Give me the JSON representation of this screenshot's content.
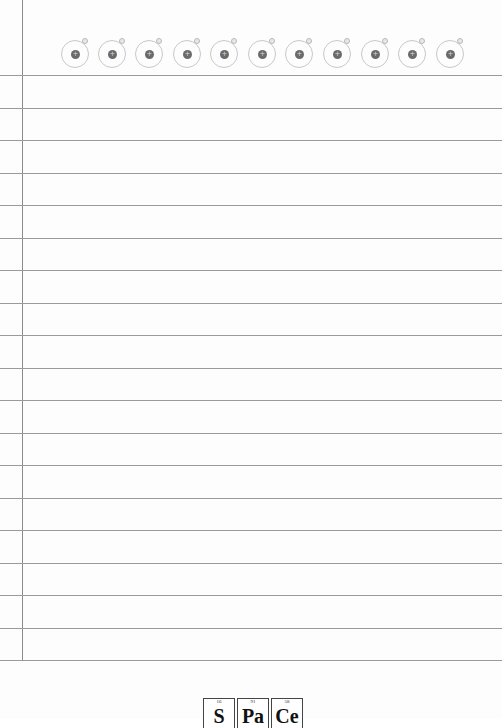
{
  "page": {
    "type": "lined notebook paper",
    "colors": {
      "background": "#fdfdfd",
      "rule_line": "#9a9a9a",
      "margin_line": "#8a8a8a",
      "atom_ring": "#c8c8c8",
      "atom_nucleus": "#6a6a6a"
    }
  },
  "header": {
    "atoms": [
      {
        "icon": "atom-icon",
        "nucleus_sign": "+",
        "x": 61
      },
      {
        "icon": "atom-icon",
        "nucleus_sign": "+",
        "x": 98
      },
      {
        "icon": "atom-icon",
        "nucleus_sign": "+",
        "x": 135
      },
      {
        "icon": "atom-icon",
        "nucleus_sign": "+",
        "x": 173
      },
      {
        "icon": "atom-icon",
        "nucleus_sign": "+",
        "x": 210
      },
      {
        "icon": "atom-icon",
        "nucleus_sign": "+",
        "x": 248
      },
      {
        "icon": "atom-icon",
        "nucleus_sign": "+",
        "x": 285
      },
      {
        "icon": "atom-icon",
        "nucleus_sign": "+",
        "x": 323
      },
      {
        "icon": "atom-icon",
        "nucleus_sign": "+",
        "x": 361
      },
      {
        "icon": "atom-icon",
        "nucleus_sign": "+",
        "x": 398
      },
      {
        "icon": "atom-icon",
        "nucleus_sign": "+",
        "x": 436
      }
    ]
  },
  "rules": {
    "y_positions": [
      75,
      108,
      140,
      173,
      205,
      238,
      270,
      303,
      335,
      368,
      400,
      433,
      465,
      498,
      530,
      563,
      595,
      628,
      660
    ]
  },
  "footer": {
    "elements": [
      {
        "symbol": "S",
        "atomic_number": "16"
      },
      {
        "symbol": "Pa",
        "atomic_number": "91"
      },
      {
        "symbol": "Ce",
        "atomic_number": "58"
      }
    ]
  }
}
